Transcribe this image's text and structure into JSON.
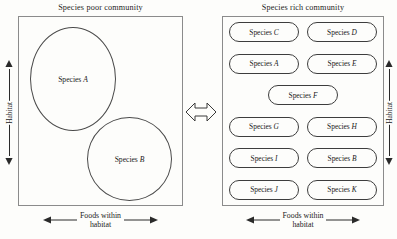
{
  "figure": {
    "stroke_color": "#4a4a4a",
    "box_border_color": "#8b8b8b",
    "background": "#fdfdfb"
  },
  "left_panel": {
    "title": "Species poor community",
    "species": [
      {
        "prefix": "Species ",
        "letter": "A"
      },
      {
        "prefix": "Species ",
        "letter": "B"
      }
    ],
    "vertical_axis_label": "Habitat",
    "horizontal_axis_label_line1": "Foods within",
    "horizontal_axis_label_line2": "habitat"
  },
  "right_panel": {
    "title": "Species rich community",
    "rows": [
      [
        {
          "prefix": "Species ",
          "letter": "C"
        },
        {
          "prefix": "Species ",
          "letter": "D"
        }
      ],
      [
        {
          "prefix": "Species ",
          "letter": "A"
        },
        {
          "prefix": "Species ",
          "letter": "E"
        }
      ],
      [
        {
          "prefix": "Species ",
          "letter": "F"
        }
      ],
      [
        {
          "prefix": "Species ",
          "letter": "G"
        },
        {
          "prefix": "Species ",
          "letter": "H"
        }
      ],
      [
        {
          "prefix": "Species ",
          "letter": "I"
        },
        {
          "prefix": "Species ",
          "letter": "B"
        }
      ],
      [
        {
          "prefix": "Species ",
          "letter": "J"
        },
        {
          "prefix": "Species ",
          "letter": "K"
        }
      ]
    ],
    "vertical_axis_label": "Habitat",
    "horizontal_axis_label_line1": "Foods within",
    "horizontal_axis_label_line2": "habitat"
  },
  "connector": {
    "icon": "double-headed-arrow-horizontal"
  }
}
